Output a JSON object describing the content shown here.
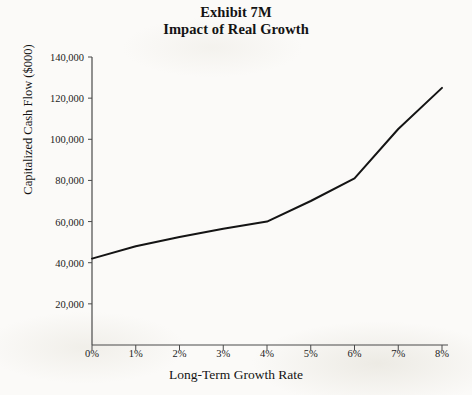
{
  "title": {
    "line1": "Exhibit 7M",
    "line2": "Impact of Real Growth"
  },
  "chart_data": {
    "type": "line",
    "xlabel": "Long-Term Growth Rate",
    "ylabel": "Capitalized Cash Flow ($000)",
    "x": [
      0,
      1,
      2,
      3,
      4,
      5,
      6,
      7,
      8
    ],
    "categories": [
      "0%",
      "1%",
      "2%",
      "3%",
      "4%",
      "5%",
      "6%",
      "7%",
      "8%"
    ],
    "values": [
      42000,
      48000,
      52500,
      56500,
      60000,
      70000,
      81000,
      105000,
      125000
    ],
    "series": [
      {
        "name": "Capitalized Cash Flow",
        "values": [
          42000,
          48000,
          52500,
          56500,
          60000,
          70000,
          81000,
          105000,
          125000
        ],
        "color": "#141414"
      }
    ],
    "xlim": [
      0,
      8
    ],
    "ylim": [
      0,
      140000
    ],
    "xticks": [
      0,
      1,
      2,
      3,
      4,
      5,
      6,
      7,
      8
    ],
    "xticklabels": [
      "0%",
      "1%",
      "2%",
      "3%",
      "4%",
      "5%",
      "6%",
      "7%",
      "8%"
    ],
    "yticks": [
      20000,
      40000,
      60000,
      80000,
      100000,
      120000,
      140000
    ],
    "yticklabels": [
      "20,000",
      "40,000",
      "60,000",
      "80,000",
      "100,000",
      "120,000",
      "140,000"
    ],
    "grid": false,
    "legend": false,
    "line_color": "#141414",
    "axis_color": "#3a3a3a",
    "background": "#fbfaf8"
  },
  "axes": {
    "y": {
      "label": "Capitalized Cash Flow ($000)",
      "ticks": [
        {
          "value": 140000,
          "label": "140,000"
        },
        {
          "value": 120000,
          "label": "120,000"
        },
        {
          "value": 100000,
          "label": "100,000"
        },
        {
          "value": 80000,
          "label": "80,000"
        },
        {
          "value": 60000,
          "label": "60,000"
        },
        {
          "value": 40000,
          "label": "40,000"
        },
        {
          "value": 20000,
          "label": "20,000"
        }
      ]
    },
    "x": {
      "label": "Long-Term Growth Rate",
      "ticks": [
        {
          "value": 0,
          "label": "0%"
        },
        {
          "value": 1,
          "label": "1%"
        },
        {
          "value": 2,
          "label": "2%"
        },
        {
          "value": 3,
          "label": "3%"
        },
        {
          "value": 4,
          "label": "4%"
        },
        {
          "value": 5,
          "label": "5%"
        },
        {
          "value": 6,
          "label": "6%"
        },
        {
          "value": 7,
          "label": "7%"
        },
        {
          "value": 8,
          "label": "8%"
        }
      ]
    }
  }
}
